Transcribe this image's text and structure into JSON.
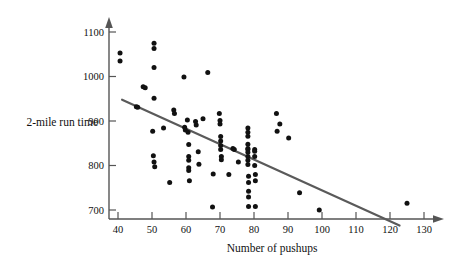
{
  "chart_data": {
    "type": "scatter",
    "title": "",
    "xlabel": "Number of pushups",
    "ylabel": "2-mile run time",
    "xlim": [
      36,
      134
    ],
    "ylim": [
      650,
      1125
    ],
    "grid": false,
    "legend": "none",
    "xticks": [
      40,
      50,
      60,
      70,
      80,
      90,
      100,
      110,
      120,
      130
    ],
    "yticks": [
      700,
      800,
      900,
      1000,
      1100
    ],
    "xtick_labels": [
      "40",
      "50",
      "60",
      "70",
      "80",
      "90",
      "100",
      "110",
      "120",
      "130"
    ],
    "ytick_labels": [
      "700",
      "800",
      "900",
      "1000",
      "1100"
    ],
    "series": [
      {
        "name": "observations",
        "marker": "filled-circle",
        "color": "#111111",
        "points": [
          [
            40.6,
            1053
          ],
          [
            40.6,
            1035
          ],
          [
            45.4,
            932
          ],
          [
            45.8,
            931
          ],
          [
            47.4,
            977
          ],
          [
            48.0,
            975
          ],
          [
            50.6,
            1075
          ],
          [
            50.6,
            1063
          ],
          [
            50.6,
            1020
          ],
          [
            50.6,
            951
          ],
          [
            50.2,
            877
          ],
          [
            50.4,
            822
          ],
          [
            50.6,
            808
          ],
          [
            50.8,
            797
          ],
          [
            53.4,
            884
          ],
          [
            55.2,
            762
          ],
          [
            56.4,
            925
          ],
          [
            56.6,
            917
          ],
          [
            59.4,
            999
          ],
          [
            59.6,
            886
          ],
          [
            59.8,
            880
          ],
          [
            60.4,
            902
          ],
          [
            60.6,
            875
          ],
          [
            60.8,
            847
          ],
          [
            60.8,
            820
          ],
          [
            60.8,
            812
          ],
          [
            60.8,
            795
          ],
          [
            60.8,
            789
          ],
          [
            61.0,
            766
          ],
          [
            62.8,
            899
          ],
          [
            63.0,
            891
          ],
          [
            63.6,
            831
          ],
          [
            63.8,
            803
          ],
          [
            66.4,
            1009
          ],
          [
            65.0,
            905
          ],
          [
            67.8,
            707
          ],
          [
            68.0,
            781
          ],
          [
            69.8,
            917
          ],
          [
            70.0,
            901
          ],
          [
            70.0,
            893
          ],
          [
            70.2,
            865
          ],
          [
            70.2,
            855
          ],
          [
            70.2,
            845
          ],
          [
            70.2,
            836
          ],
          [
            70.4,
            820
          ],
          [
            70.4,
            813
          ],
          [
            72.6,
            780
          ],
          [
            73.8,
            838
          ],
          [
            74.2,
            836
          ],
          [
            75.4,
            808
          ],
          [
            78.2,
            884
          ],
          [
            78.2,
            875
          ],
          [
            78.2,
            866
          ],
          [
            78.2,
            848
          ],
          [
            78.2,
            838
          ],
          [
            78.2,
            836
          ],
          [
            78.2,
            830
          ],
          [
            78.2,
            820
          ],
          [
            78.2,
            812
          ],
          [
            78.2,
            802
          ],
          [
            78.4,
            776
          ],
          [
            78.4,
            762
          ],
          [
            78.4,
            742
          ],
          [
            78.4,
            729
          ],
          [
            78.4,
            708
          ],
          [
            80.2,
            836
          ],
          [
            80.2,
            832
          ],
          [
            80.2,
            820
          ],
          [
            80.2,
            800
          ],
          [
            80.4,
            780
          ],
          [
            80.4,
            766
          ],
          [
            80.4,
            708
          ],
          [
            86.6,
            917
          ],
          [
            86.8,
            877
          ],
          [
            87.6,
            893
          ],
          [
            90.2,
            862
          ],
          [
            93.4,
            739
          ],
          [
            99.2,
            700
          ],
          [
            125.0,
            715
          ]
        ]
      }
    ],
    "trendline": {
      "name": "least-squares-line",
      "color": "#5a5a5a",
      "x_start": 41.2,
      "y_start": 948,
      "x_end": 122.8,
      "y_end": 665
    }
  },
  "axes": {
    "x_axis_name": "x-axis",
    "y_axis_name": "y-axis",
    "arrow_style": "filled-triangle"
  }
}
